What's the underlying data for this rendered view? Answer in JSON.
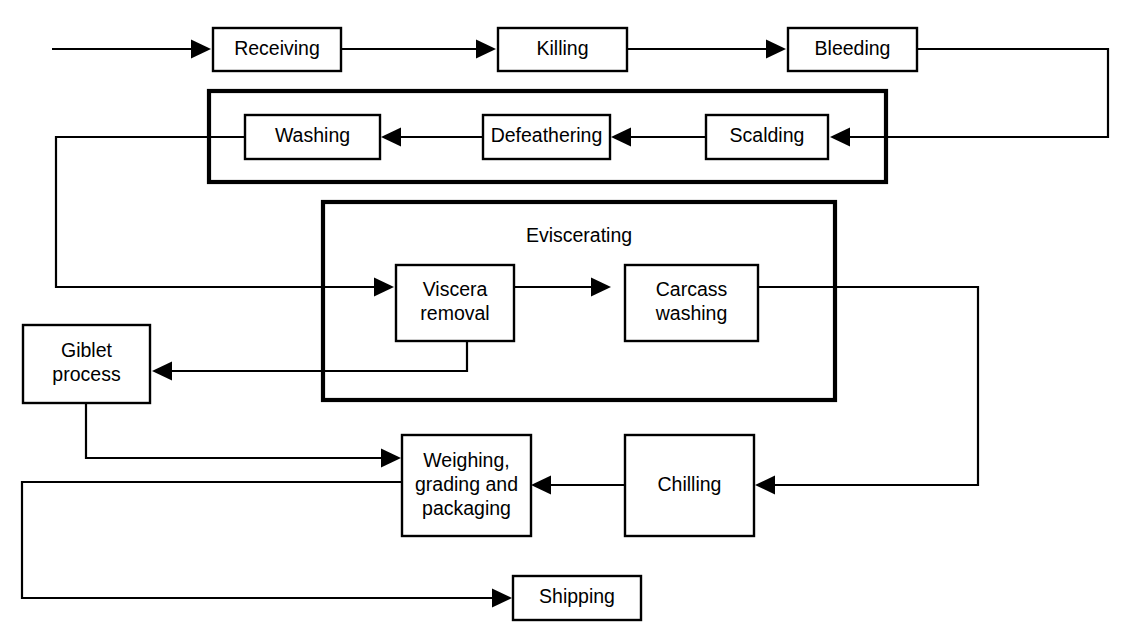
{
  "diagram": {
    "line_color": "#000000",
    "background_color": "#ffffff",
    "nodes": [
      {
        "id": "receiving",
        "label": "Receiving",
        "x": 213,
        "y": 28,
        "w": 128,
        "h": 43,
        "lines": [
          "Receiving"
        ]
      },
      {
        "id": "killing",
        "label": "Killing",
        "x": 498,
        "y": 28,
        "w": 129,
        "h": 43,
        "lines": [
          "Killing"
        ]
      },
      {
        "id": "bleeding",
        "label": "Bleeding",
        "x": 788,
        "y": 28,
        "w": 129,
        "h": 43,
        "lines": [
          "Bleeding"
        ]
      },
      {
        "id": "scalding",
        "label": "Scalding",
        "x": 706,
        "y": 115,
        "w": 122,
        "h": 44,
        "lines": [
          "Scalding"
        ]
      },
      {
        "id": "defeathering",
        "label": "Defeathering",
        "x": 483,
        "y": 115,
        "w": 127,
        "h": 44,
        "lines": [
          "Defeathering"
        ]
      },
      {
        "id": "washing",
        "label": "Washing",
        "x": 245,
        "y": 115,
        "w": 135,
        "h": 44,
        "lines": [
          "Washing"
        ]
      },
      {
        "id": "viscera",
        "label": "Viscera removal",
        "x": 396,
        "y": 265,
        "w": 118,
        "h": 76,
        "lines": [
          "Viscera",
          "removal"
        ]
      },
      {
        "id": "carcass",
        "label": "Carcass washing",
        "x": 625,
        "y": 265,
        "w": 133,
        "h": 76,
        "lines": [
          "Carcass",
          "washing"
        ]
      },
      {
        "id": "giblet",
        "label": "Giblet process",
        "x": 23,
        "y": 325,
        "w": 127,
        "h": 78,
        "lines": [
          "Giblet",
          "process"
        ]
      },
      {
        "id": "weighing",
        "label": "Weighing, grading and packaging",
        "x": 402,
        "y": 435,
        "w": 129,
        "h": 101,
        "lines": [
          "Weighing,",
          "grading and",
          "packaging"
        ]
      },
      {
        "id": "chilling",
        "label": "Chilling",
        "x": 625,
        "y": 435,
        "w": 129,
        "h": 101,
        "lines": [
          "Chilling"
        ]
      },
      {
        "id": "shipping",
        "label": "Shipping",
        "x": 513,
        "y": 576,
        "w": 128,
        "h": 44,
        "lines": [
          "Shipping"
        ]
      }
    ],
    "groups": [
      {
        "id": "defeathering-group",
        "label": "",
        "x": 209,
        "y": 91,
        "w": 677,
        "h": 91
      },
      {
        "id": "eviscerating-group",
        "label": "Eviscerating",
        "x": 323,
        "y": 202,
        "w": 512,
        "h": 198,
        "label_x": 579,
        "label_y": 237
      }
    ],
    "connectors": [
      {
        "id": "input-to-receiving",
        "from": "input",
        "to": "receiving",
        "path": "M 52,49 L 196,49",
        "arrow": {
          "x": 211,
          "y": 49,
          "dir": "right"
        }
      },
      {
        "id": "receiving-to-killing",
        "from": "receiving",
        "to": "killing",
        "path": "M 341,49 L 483,49",
        "arrow": {
          "x": 496,
          "y": 49,
          "dir": "right"
        }
      },
      {
        "id": "killing-to-bleeding",
        "from": "killing",
        "to": "bleeding",
        "path": "M 627,49 L 773,49",
        "arrow": {
          "x": 786,
          "y": 49,
          "dir": "right"
        }
      },
      {
        "id": "bleeding-to-scalding",
        "from": "bleeding",
        "to": "scalding",
        "path": "M 917,49 L 1108,49 L 1108,137 L 845,137",
        "arrow": {
          "x": 830,
          "y": 137,
          "dir": "left"
        }
      },
      {
        "id": "scalding-to-defeathering",
        "from": "scalding",
        "to": "defeathering",
        "path": "M 706,137 L 625,137",
        "arrow": {
          "x": 611,
          "y": 137,
          "dir": "left"
        }
      },
      {
        "id": "defeathering-to-washing",
        "from": "defeathering",
        "to": "washing",
        "path": "M 483,137 L 395,137",
        "arrow": {
          "x": 381,
          "y": 137,
          "dir": "left"
        }
      },
      {
        "id": "washing-to-viscera",
        "from": "washing",
        "to": "viscera",
        "path": "M 245,137 L 56,137 L 56,287 L 381,287",
        "arrow": {
          "x": 394,
          "y": 287,
          "dir": "right"
        }
      },
      {
        "id": "viscera-to-carcass",
        "from": "viscera",
        "to": "carcass",
        "path": "M 514,287 L 597,287",
        "arrow": {
          "x": 611,
          "y": 287,
          "dir": "right"
        }
      },
      {
        "id": "viscera-to-giblet",
        "from": "viscera",
        "to": "giblet",
        "path": "M 467,341 L 467,371 L 166,371",
        "arrow": {
          "x": 152,
          "y": 371,
          "dir": "left"
        }
      },
      {
        "id": "carcass-to-chilling",
        "from": "carcass",
        "to": "chilling",
        "path": "M 758,287 L 978,287 L 978,485 L 769,485",
        "arrow": {
          "x": 755,
          "y": 485,
          "dir": "left"
        }
      },
      {
        "id": "chilling-to-weighing",
        "from": "chilling",
        "to": "weighing",
        "path": "M 625,485 L 545,485",
        "arrow": {
          "x": 531,
          "y": 485,
          "dir": "left"
        }
      },
      {
        "id": "giblet-to-weighing",
        "from": "giblet",
        "to": "weighing",
        "path": "M 86,403 L 86,458 L 388,458",
        "arrow": {
          "x": 401,
          "y": 458,
          "dir": "right"
        }
      },
      {
        "id": "weighing-to-shipping",
        "from": "weighing",
        "to": "shipping",
        "path": "M 402,482 L 22,482 L 22,598 L 499,598",
        "arrow": {
          "x": 512,
          "y": 598,
          "dir": "right"
        }
      }
    ]
  }
}
